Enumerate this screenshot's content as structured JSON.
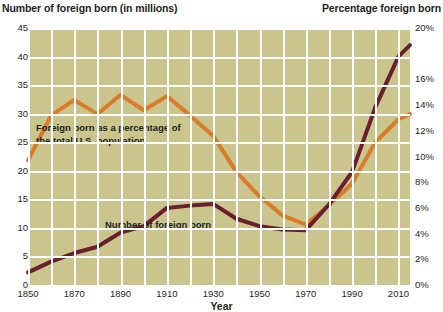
{
  "titles": {
    "left_axis": "Number of foreign born (in millions)",
    "right_axis": "Percentage foreign born",
    "x_axis": "Year"
  },
  "annotations": {
    "orange_line_1": "Foreign born as a percentage of",
    "orange_line_2": "the total U.S. population",
    "maroon_line": "Number of foreign born"
  },
  "colors": {
    "plot_background": "#c9c58c",
    "gridline": "#ffffff",
    "orange_series": "#d97b2b",
    "maroon_series": "#6b1f2e",
    "text": "#231f20",
    "page_background": "#ffffff"
  },
  "axes": {
    "left_ticks": [
      "0",
      "5",
      "10",
      "15",
      "20",
      "25",
      "30",
      "35",
      "40",
      "45"
    ],
    "right_ticks": [
      "0%",
      "2%",
      "4%",
      "6%",
      "8%",
      "10%",
      "12%",
      "14%",
      "16%",
      "20%"
    ],
    "x_ticks": [
      "1850",
      "1870",
      "1890",
      "1910",
      "1930",
      "1950",
      "1970",
      "1990",
      "2010"
    ],
    "left_range": [
      0,
      45
    ],
    "right_range": [
      0,
      20
    ],
    "x_range": [
      1850,
      2015
    ],
    "grid": "both"
  },
  "chart_data": {
    "type": "line",
    "title": "",
    "subtitle": "",
    "xlabel": "Year",
    "ylabel": "Number of foreign born (in millions)",
    "ylabel_secondary": "Percentage foreign born",
    "xlim": [
      1850,
      2015
    ],
    "ylim": [
      0,
      45
    ],
    "ylim_secondary": [
      0,
      20
    ],
    "grid": true,
    "legend": "inline-annotations",
    "x": [
      1850,
      1860,
      1870,
      1880,
      1890,
      1900,
      1910,
      1920,
      1930,
      1940,
      1950,
      1960,
      1970,
      1980,
      1990,
      2000,
      2010,
      2015
    ],
    "series": [
      {
        "name": "Foreign born as a percentage of the total U.S. population",
        "axis": "right",
        "unit": "%",
        "color": "#d97b2b",
        "values": [
          9.7,
          13.2,
          14.4,
          13.3,
          14.8,
          13.6,
          14.7,
          13.2,
          11.6,
          8.8,
          6.9,
          5.4,
          4.7,
          6.2,
          7.9,
          11.1,
          12.9,
          13.3
        ]
      },
      {
        "name": "Number of foreign born",
        "axis": "left",
        "unit": "millions",
        "color": "#6b1f2e",
        "values": [
          2.2,
          4.1,
          5.6,
          6.7,
          9.2,
          10.3,
          13.5,
          13.9,
          14.2,
          11.6,
          10.3,
          9.7,
          9.6,
          14.1,
          19.8,
          31.1,
          40.0,
          42.0
        ]
      }
    ]
  }
}
